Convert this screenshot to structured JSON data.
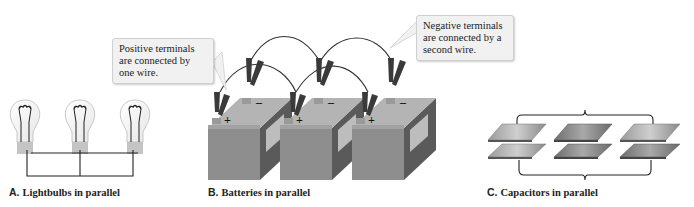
{
  "panels": [
    {
      "letter": "A.",
      "caption": "Lightbulbs in parallel",
      "subject": "lightbulbs",
      "count": 3
    },
    {
      "letter": "B.",
      "caption": "Batteries in parallel",
      "subject": "batteries",
      "count": 3,
      "terminal_labels": {
        "positive": "+",
        "negative": "−"
      }
    },
    {
      "letter": "C.",
      "caption": "Capacitors in parallel",
      "subject": "capacitors",
      "count": 3
    }
  ],
  "callouts": {
    "positive": "Positive terminals are connected by one wire.",
    "negative": "Negative terminals are connected by a second wire."
  },
  "colors": {
    "battery_front": "#8e8e8e",
    "battery_side": "#5a5a5a",
    "battery_top": "#b4b4b4",
    "clip": "#3a3a3a",
    "callout_bg": "#f1f1f1"
  }
}
